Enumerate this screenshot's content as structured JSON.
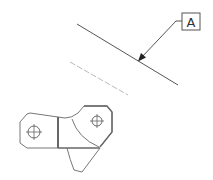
{
  "drawing": {
    "type": "cad-detail-view",
    "datum": {
      "label": "A"
    },
    "colors": {
      "line": "#555555",
      "light_line": "#b5b5b5",
      "outline": "#777777",
      "thick_edge": "#6a6a6a",
      "background": "#ffffff"
    },
    "elements": [
      "datum-edge-line",
      "hidden-construction-line",
      "datum-leader-arrow",
      "datum-label-box",
      "bracket-part-outline",
      "hole-left",
      "hole-right"
    ]
  }
}
